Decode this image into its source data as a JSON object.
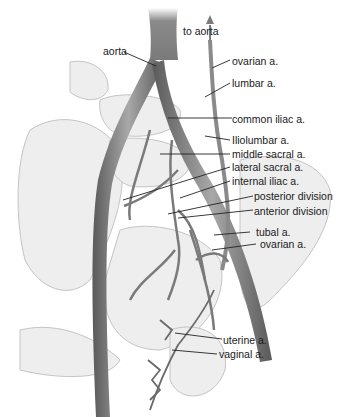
{
  "figure": {
    "labels": {
      "to_aorta": "to aorta",
      "aorta": "aorta",
      "ovarian_upper": "ovarian a.",
      "lumbar": "lumbar a.",
      "common_iliac": "common iliac a.",
      "iliolumbar": "Iliolumbar a.",
      "middle_sacral": "middle sacral a.",
      "lateral_sacral": "lateral sacral a.",
      "internal_iliac": "internal iliac a.",
      "posterior_division": "posterior division",
      "anterior_division": "anterior division",
      "tubal": "tubal a.",
      "ovarian_lower": "ovarian a.",
      "uterine": "uterine a.",
      "vaginal": "vaginal a."
    },
    "colors": {
      "vessel_dark": "#6e6e6e",
      "vessel_mid": "#9a9a9a",
      "bone": "#e6e6e6",
      "bone_outline": "#bdbdbd",
      "leader_line": "#222222",
      "text": "#1a1a1a"
    }
  }
}
